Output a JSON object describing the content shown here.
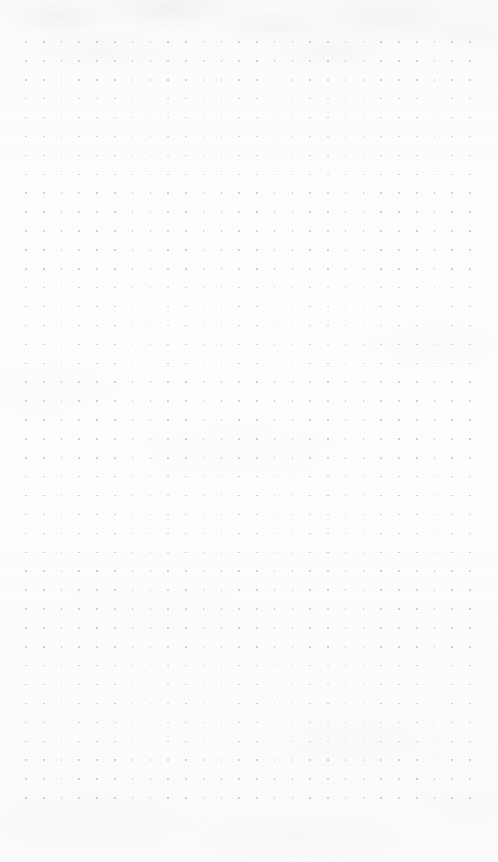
{
  "document": {
    "kind": "dot-grid-paper",
    "title": "Dot Grid Paper",
    "content_text": "",
    "has_text_content": false,
    "has_handwriting": false,
    "notes_written": 0
  },
  "canvas": {
    "width": 498,
    "height": 862,
    "background_color": "#fdfdfe",
    "paper_tint_color": "#fafafb",
    "texture": "subtle-mottled-fibre",
    "texture_patch_color": "#eeeef2"
  },
  "grid": {
    "type": "dot",
    "dot_color": "#c9c9ce",
    "dot_size_px": 1.6,
    "columns": 26,
    "rows": 41,
    "spacing_x_px": 17.76,
    "spacing_y_px": 18.9,
    "origin_x_px": 26,
    "origin_y_px": 42,
    "last_dot_x_px": 470,
    "last_dot_y_px": 798
  },
  "margins": {
    "left_px": 26,
    "right_px": 28,
    "top_px": 42,
    "bottom_px": 64
  }
}
